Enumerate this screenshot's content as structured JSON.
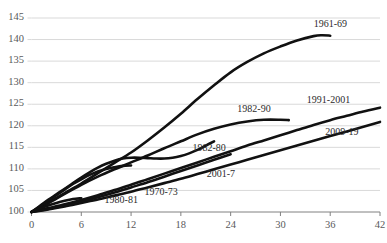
{
  "chart_data": {
    "type": "line",
    "title": "",
    "cut_off_header": "",
    "xlabel": "",
    "ylabel": "",
    "xlim": [
      0,
      42
    ],
    "ylim": [
      100,
      145
    ],
    "ytick_values": [
      100,
      105,
      110,
      115,
      120,
      125,
      130,
      135,
      140,
      145
    ],
    "xtick_values": [
      0,
      6,
      12,
      18,
      24,
      30,
      36,
      42
    ],
    "grid": true,
    "legend_position": "inline-annotations",
    "index_base": 100,
    "line_color": "#111111",
    "grid_color": "#d9d9d9",
    "axis_color": "#808080",
    "series": [
      {
        "name": "1961-69",
        "label": "1961-69",
        "x": [
          0,
          2,
          4,
          6,
          8,
          10,
          12,
          14,
          16,
          18,
          20,
          22,
          24,
          26,
          28,
          30,
          32,
          34,
          35,
          36
        ],
        "values": [
          100,
          102.2,
          104.4,
          106.6,
          109.0,
          111.4,
          113.8,
          116.6,
          119.6,
          122.8,
          126.2,
          129.4,
          132.4,
          134.8,
          136.8,
          138.4,
          139.8,
          140.8,
          141.0,
          140.9
        ]
      },
      {
        "name": "1991-2001",
        "label": "1991-2001",
        "x": [
          0,
          2,
          4,
          6,
          8,
          10,
          12,
          14,
          16,
          18,
          20,
          22,
          24,
          26,
          28,
          30,
          32,
          34,
          36,
          38,
          40,
          42
        ],
        "values": [
          100,
          100.9,
          101.8,
          102.8,
          103.9,
          105.1,
          106.3,
          107.6,
          108.9,
          110.2,
          111.5,
          112.8,
          114.1,
          115.4,
          116.6,
          117.8,
          119.0,
          120.2,
          121.3,
          122.3,
          123.3,
          124.2
        ]
      },
      {
        "name": "1982-90",
        "label": "1982-90",
        "x": [
          0,
          2,
          4,
          6,
          8,
          10,
          12,
          14,
          16,
          18,
          20,
          22,
          24,
          26,
          28,
          30,
          31
        ],
        "values": [
          100,
          102.0,
          104.2,
          106.3,
          108.2,
          109.9,
          111.5,
          113.1,
          114.8,
          116.4,
          118.0,
          119.3,
          120.3,
          121.0,
          121.4,
          121.4,
          121.3
        ]
      },
      {
        "name": "2009-19",
        "label": "2009-19",
        "x": [
          0,
          2,
          4,
          6,
          8,
          10,
          12,
          14,
          16,
          18,
          20,
          22,
          24,
          26,
          28,
          30,
          32,
          34,
          36,
          38,
          40,
          42
        ],
        "values": [
          100,
          100.6,
          101.3,
          102.1,
          102.9,
          103.8,
          104.7,
          105.7,
          106.7,
          107.7,
          108.8,
          109.9,
          111.0,
          112.1,
          113.2,
          114.3,
          115.4,
          116.5,
          117.6,
          118.7,
          119.8,
          120.9
        ]
      },
      {
        "name": "1982-80",
        "label": "1982-80",
        "x": [
          0,
          1,
          2,
          3,
          4,
          5,
          6,
          7,
          8,
          9,
          10,
          11,
          12,
          13,
          14,
          15,
          16,
          17,
          18,
          19,
          20,
          21,
          22
        ],
        "values": [
          100,
          101.4,
          102.8,
          104.1,
          105.4,
          106.7,
          108.0,
          109.2,
          110.3,
          111.2,
          111.9,
          112.4,
          112.6,
          112.6,
          112.5,
          112.4,
          112.4,
          112.6,
          113.0,
          113.6,
          114.4,
          115.4,
          116.4
        ]
      },
      {
        "name": "2001-7",
        "label": "2001-7",
        "x": [
          0,
          2,
          4,
          6,
          8,
          10,
          12,
          14,
          16,
          18,
          20,
          22,
          24
        ],
        "values": [
          100,
          100.7,
          101.5,
          102.4,
          103.4,
          104.5,
          105.7,
          106.9,
          108.2,
          109.5,
          110.8,
          112.1,
          113.4
        ]
      },
      {
        "name": "1970-73",
        "label": "1970-73",
        "x": [
          0,
          1,
          2,
          3,
          4,
          5,
          6,
          7,
          8,
          9,
          10,
          11,
          12
        ],
        "values": [
          100,
          101.3,
          102.6,
          103.9,
          105.2,
          106.5,
          107.6,
          108.6,
          109.4,
          110.0,
          110.4,
          110.7,
          110.8
        ]
      },
      {
        "name": "1980-81",
        "label": "1980-81",
        "x": [
          0,
          1,
          2,
          3,
          4,
          5,
          6
        ],
        "values": [
          100,
          100.8,
          101.5,
          102.1,
          102.6,
          103.0,
          103.2
        ]
      }
    ],
    "annotations": [
      {
        "text": "1961-69",
        "x": 36.2,
        "y": 143.4
      },
      {
        "text": "1991-2001",
        "x": 36.0,
        "y": 125.8
      },
      {
        "text": "1982-90",
        "x": 27.0,
        "y": 123.6
      },
      {
        "text": "2009-19",
        "x": 37.6,
        "y": 118.4
      },
      {
        "text": "1982-80",
        "x": 21.6,
        "y": 114.6
      },
      {
        "text": "2001-7",
        "x": 23.0,
        "y": 108.6
      },
      {
        "text": "1970-73",
        "x": 15.8,
        "y": 104.4
      },
      {
        "text": "1980-81",
        "x": 11.0,
        "y": 102.6
      }
    ]
  }
}
